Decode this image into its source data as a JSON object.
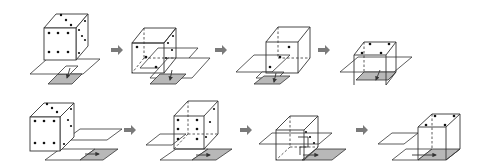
{
  "diagram": {
    "colors": {
      "line": "#333333",
      "shaded_plate": "#b8b8b8",
      "pip": "#111111",
      "sequence_arrow": "#7a7a7a",
      "background": "#ffffff"
    },
    "rows": [
      {
        "id": "top",
        "direction": "down-left (toward viewer)",
        "steps": [
          {
            "state": "die on plates, front face six pips, right face visible"
          },
          {
            "state": "die moving forward, faces partially transparent with dashed hidden edges"
          },
          {
            "state": "die further forward over plates"
          },
          {
            "state": "die arrived on shaded square, top face four pips"
          }
        ],
        "arrows": 3
      },
      {
        "id": "bottom",
        "direction": "right",
        "steps": [
          {
            "state": "die on plates, front face six pips"
          },
          {
            "state": "die moving right, transparent faces"
          },
          {
            "state": "die further right over plates"
          },
          {
            "state": "die arrived on shaded square, top face four pips"
          }
        ],
        "arrows": 3
      }
    ]
  }
}
